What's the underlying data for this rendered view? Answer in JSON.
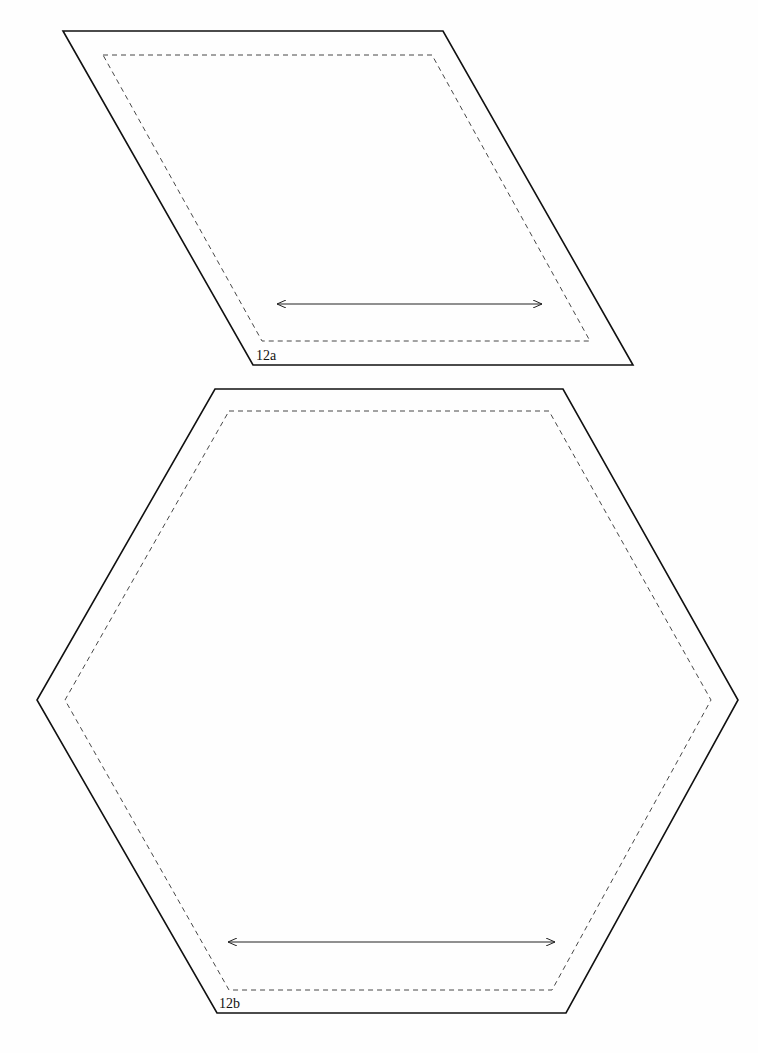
{
  "pieces": [
    {
      "id": "12a",
      "label": "12a",
      "shape": "parallelogram",
      "cut_line": [
        [
          63,
          31
        ],
        [
          443,
          31
        ],
        [
          633,
          365
        ],
        [
          253,
          365
        ]
      ],
      "sew_line": [
        [
          103,
          55
        ],
        [
          432,
          55
        ],
        [
          590,
          341
        ],
        [
          262,
          341
        ]
      ],
      "grain_arrow": {
        "x1": 277,
        "y1": 304,
        "x2": 542,
        "y2": 304
      },
      "label_pos": [
        256,
        360
      ]
    },
    {
      "id": "12b",
      "label": "12b",
      "shape": "hexagon",
      "cut_line": [
        [
          215,
          389
        ],
        [
          563,
          389
        ],
        [
          738,
          700
        ],
        [
          566,
          1013
        ],
        [
          217,
          1013
        ],
        [
          37,
          700
        ]
      ],
      "sew_line": [
        [
          229,
          411
        ],
        [
          549,
          411
        ],
        [
          711,
          700
        ],
        [
          552,
          990
        ],
        [
          229,
          990
        ],
        [
          65,
          700
        ]
      ],
      "grain_arrow": {
        "x1": 228,
        "y1": 942,
        "x2": 555,
        "y2": 942
      },
      "label_pos": [
        219,
        1008
      ]
    }
  ],
  "colors": {
    "cut_line": "#111111",
    "sew_line": "#333333",
    "background": "#fefefe"
  }
}
